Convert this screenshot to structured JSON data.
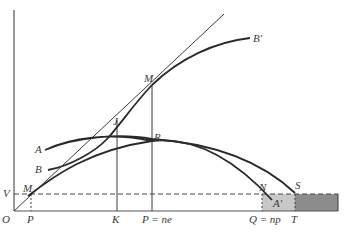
{
  "diagram": {
    "type": "economic-geometry-figure",
    "labels": {
      "origin": "O",
      "v": "V",
      "m_low": "M",
      "m_high": "M",
      "p_low": "P",
      "k": "K",
      "p_ne": "P = ne",
      "q_np": "Q = np",
      "t": "T",
      "a": "A",
      "b": "B",
      "b_prime": "B'",
      "j": "J",
      "r": "R",
      "n": "N",
      "s": "S",
      "a_prime": "A'"
    },
    "colors": {
      "light_shade": "#c4c4c4",
      "dark_shade": "#8a8a8a",
      "ink": "#2a2a2a"
    }
  }
}
